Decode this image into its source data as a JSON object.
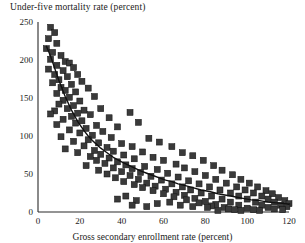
{
  "chart_data": {
    "type": "scatter",
    "title": "Under-five mortality rate (percent)",
    "xlabel": "Gross secondary enrollment rate (percent)",
    "ylabel": "Under-five mortality rate (percent)",
    "xlim": [
      0,
      120
    ],
    "ylim": [
      0,
      250
    ],
    "xticks": [
      0,
      20,
      40,
      60,
      80,
      100,
      120
    ],
    "yticks": [
      0,
      50,
      100,
      150,
      200,
      250
    ],
    "grid": false,
    "legend": null,
    "marker": {
      "shape": "square",
      "color": "#3a3a3a",
      "size": 6
    },
    "fit_curve": {
      "name": "fitted trend",
      "color": "#111111",
      "width": 1.4,
      "points": [
        [
          4,
          218
        ],
        [
          5,
          212
        ],
        [
          6,
          205
        ],
        [
          7,
          197
        ],
        [
          8,
          189
        ],
        [
          9,
          181
        ],
        [
          10,
          173
        ],
        [
          11,
          166
        ],
        [
          12,
          159
        ],
        [
          13,
          152
        ],
        [
          14,
          146
        ],
        [
          15,
          140
        ],
        [
          16,
          134
        ],
        [
          17,
          129
        ],
        [
          18,
          124
        ],
        [
          19,
          119
        ],
        [
          20,
          115
        ],
        [
          22,
          107
        ],
        [
          24,
          100
        ],
        [
          26,
          94
        ],
        [
          28,
          89
        ],
        [
          30,
          84
        ],
        [
          32,
          80
        ],
        [
          34,
          76
        ],
        [
          36,
          72
        ],
        [
          38,
          69
        ],
        [
          40,
          66
        ],
        [
          43,
          62
        ],
        [
          46,
          58
        ],
        [
          49,
          54
        ],
        [
          52,
          51
        ],
        [
          55,
          48
        ],
        [
          58,
          45
        ],
        [
          61,
          42
        ],
        [
          64,
          40
        ],
        [
          67,
          37
        ],
        [
          70,
          35
        ],
        [
          74,
          32
        ],
        [
          78,
          29
        ],
        [
          82,
          27
        ],
        [
          86,
          24
        ],
        [
          90,
          22
        ],
        [
          94,
          20
        ],
        [
          98,
          18
        ],
        [
          102,
          16
        ],
        [
          106,
          15
        ],
        [
          110,
          13
        ],
        [
          114,
          12
        ],
        [
          118,
          11
        ],
        [
          120,
          10
        ]
      ]
    },
    "points": [
      [
        6,
        243
      ],
      [
        8,
        236
      ],
      [
        5,
        228
      ],
      [
        9,
        222
      ],
      [
        4,
        215
      ],
      [
        7,
        210
      ],
      [
        11,
        206
      ],
      [
        6,
        201
      ],
      [
        13,
        198
      ],
      [
        9,
        193
      ],
      [
        15,
        196
      ],
      [
        5,
        188
      ],
      [
        12,
        186
      ],
      [
        17,
        190
      ],
      [
        8,
        181
      ],
      [
        14,
        178
      ],
      [
        10,
        174
      ],
      [
        19,
        181
      ],
      [
        7,
        170
      ],
      [
        16,
        168
      ],
      [
        11,
        164
      ],
      [
        21,
        172
      ],
      [
        13,
        160
      ],
      [
        9,
        156
      ],
      [
        18,
        158
      ],
      [
        15,
        151
      ],
      [
        24,
        163
      ],
      [
        12,
        147
      ],
      [
        20,
        146
      ],
      [
        10,
        142
      ],
      [
        17,
        140
      ],
      [
        27,
        152
      ],
      [
        14,
        136
      ],
      [
        22,
        134
      ],
      [
        8,
        133
      ],
      [
        19,
        130
      ],
      [
        6,
        129
      ],
      [
        25,
        128
      ],
      [
        16,
        126
      ],
      [
        30,
        136
      ],
      [
        12,
        122
      ],
      [
        21,
        120
      ],
      [
        34,
        124
      ],
      [
        18,
        117
      ],
      [
        9,
        115
      ],
      [
        28,
        114
      ],
      [
        23,
        110
      ],
      [
        15,
        108
      ],
      [
        38,
        112
      ],
      [
        31,
        106
      ],
      [
        20,
        104
      ],
      [
        26,
        101
      ],
      [
        44,
        131
      ],
      [
        11,
        99
      ],
      [
        35,
        98
      ],
      [
        24,
        95
      ],
      [
        17,
        93
      ],
      [
        29,
        91
      ],
      [
        48,
        118
      ],
      [
        40,
        90
      ],
      [
        22,
        87
      ],
      [
        33,
        85
      ],
      [
        13,
        83
      ],
      [
        27,
        81
      ],
      [
        53,
        97
      ],
      [
        45,
        86
      ],
      [
        36,
        80
      ],
      [
        19,
        78
      ],
      [
        30,
        76
      ],
      [
        58,
        92
      ],
      [
        41,
        75
      ],
      [
        25,
        73
      ],
      [
        50,
        79
      ],
      [
        34,
        71
      ],
      [
        64,
        86
      ],
      [
        46,
        70
      ],
      [
        28,
        68
      ],
      [
        38,
        66
      ],
      [
        55,
        72
      ],
      [
        69,
        78
      ],
      [
        32,
        64
      ],
      [
        42,
        62
      ],
      [
        60,
        68
      ],
      [
        23,
        61
      ],
      [
        51,
        60
      ],
      [
        74,
        74
      ],
      [
        36,
        58
      ],
      [
        66,
        63
      ],
      [
        45,
        57
      ],
      [
        29,
        55
      ],
      [
        57,
        56
      ],
      [
        79,
        68
      ],
      [
        40,
        53
      ],
      [
        70,
        58
      ],
      [
        49,
        52
      ],
      [
        33,
        50
      ],
      [
        62,
        51
      ],
      [
        84,
        61
      ],
      [
        44,
        48
      ],
      [
        75,
        53
      ],
      [
        54,
        47
      ],
      [
        37,
        45
      ],
      [
        67,
        46
      ],
      [
        88,
        55
      ],
      [
        48,
        43
      ],
      [
        80,
        48
      ],
      [
        59,
        42
      ],
      [
        41,
        40
      ],
      [
        72,
        41
      ],
      [
        93,
        49
      ],
      [
        52,
        38
      ],
      [
        85,
        43
      ],
      [
        64,
        37
      ],
      [
        46,
        36
      ],
      [
        77,
        37
      ],
      [
        97,
        43
      ],
      [
        56,
        34
      ],
      [
        90,
        38
      ],
      [
        69,
        33
      ],
      [
        50,
        32
      ],
      [
        82,
        33
      ],
      [
        101,
        38
      ],
      [
        61,
        30
      ],
      [
        95,
        33
      ],
      [
        73,
        29
      ],
      [
        55,
        28
      ],
      [
        87,
        29
      ],
      [
        105,
        33
      ],
      [
        66,
        26
      ],
      [
        99,
        29
      ],
      [
        78,
        25
      ],
      [
        60,
        24
      ],
      [
        92,
        25
      ],
      [
        109,
        28
      ],
      [
        70,
        22
      ],
      [
        103,
        25
      ],
      [
        83,
        21
      ],
      [
        65,
        20
      ],
      [
        96,
        21
      ],
      [
        112,
        24
      ],
      [
        75,
        18
      ],
      [
        107,
        21
      ],
      [
        88,
        17
      ],
      [
        71,
        16
      ],
      [
        100,
        17
      ],
      [
        115,
        19
      ],
      [
        80,
        14
      ],
      [
        110,
        17
      ],
      [
        92,
        13
      ],
      [
        77,
        12
      ],
      [
        104,
        13
      ],
      [
        118,
        15
      ],
      [
        85,
        10
      ],
      [
        113,
        13
      ],
      [
        96,
        9
      ],
      [
        83,
        8
      ],
      [
        107,
        9
      ],
      [
        120,
        11
      ],
      [
        89,
        6
      ],
      [
        116,
        9
      ],
      [
        100,
        5
      ],
      [
        91,
        4
      ],
      [
        110,
        6
      ],
      [
        119,
        7
      ],
      [
        94,
        3
      ],
      [
        103,
        3
      ],
      [
        86,
        2
      ],
      [
        113,
        4
      ],
      [
        97,
        2
      ],
      [
        106,
        2
      ],
      [
        117,
        3
      ],
      [
        47,
        15
      ],
      [
        57,
        11
      ],
      [
        63,
        13
      ],
      [
        68,
        9
      ],
      [
        74,
        7
      ],
      [
        81,
        6
      ],
      [
        45,
        9
      ],
      [
        52,
        7
      ],
      [
        38,
        17
      ],
      [
        42,
        21
      ]
    ]
  }
}
